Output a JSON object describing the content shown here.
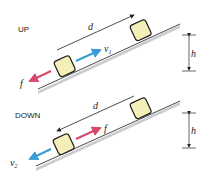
{
  "diagram": {
    "panels": [
      {
        "id": "up",
        "title": "UP",
        "distance_label": "d",
        "velocity_label": "v",
        "velocity_sub": "1",
        "friction_label": "f",
        "height_label": "h"
      },
      {
        "id": "down",
        "title": "DOWN",
        "distance_label": "d",
        "velocity_label": "v",
        "velocity_sub": "2",
        "friction_label": "f",
        "height_label": "h"
      }
    ],
    "colors": {
      "block_fill": "#f4efb8",
      "block_stroke": "#1a1a1a",
      "velocity_arrow": "#3a9bd8",
      "friction_arrow": "#d9466a",
      "incline_line": "#333333",
      "incline_shadow": "#c9ccd0"
    }
  }
}
